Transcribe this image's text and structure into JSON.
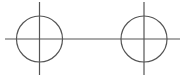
{
  "diagram": {
    "stroke_color": "#555555",
    "stroke_width": 1.2,
    "baseline": {
      "x1": 5,
      "y1": 39,
      "x2": 180,
      "y2": 39
    },
    "nodes": [
      {
        "id": "left-node",
        "circle": {
          "cx": 39.5,
          "cy": 39,
          "r": 23
        },
        "crosshair_vertical": {
          "x": 39.5,
          "y1": 2,
          "y2": 75
        }
      },
      {
        "id": "right-node",
        "circle": {
          "cx": 144,
          "cy": 39,
          "r": 23
        },
        "crosshair_vertical": {
          "x": 144,
          "y1": 2,
          "y2": 75
        }
      }
    ]
  }
}
